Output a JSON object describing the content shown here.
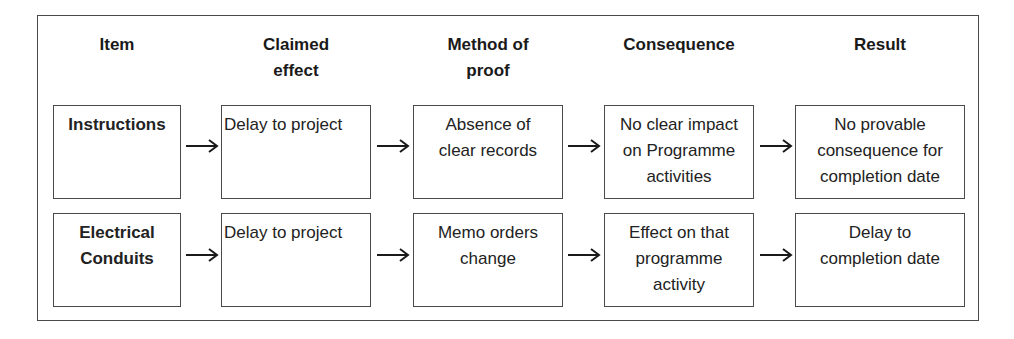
{
  "headers": {
    "item": "Item",
    "claimed_effect": [
      "Claimed",
      "effect"
    ],
    "method_of_proof": [
      "Method of",
      "proof"
    ],
    "consequence": "Consequence",
    "result": "Result"
  },
  "rows": [
    {
      "item": [
        "Instructions"
      ],
      "claimed_effect": [
        "Delay to project"
      ],
      "method_of_proof": [
        "Absence of",
        "clear records"
      ],
      "consequence": [
        "No clear impact",
        "on Programme",
        "activities"
      ],
      "result": [
        "No provable",
        "consequence for",
        "completion date"
      ]
    },
    {
      "item": [
        "Electrical",
        "Conduits"
      ],
      "claimed_effect": [
        "Delay to project"
      ],
      "method_of_proof": [
        "Memo orders",
        "change"
      ],
      "consequence": [
        "Effect on that",
        "programme",
        "activity"
      ],
      "result": [
        "Delay to",
        "completion date"
      ]
    }
  ],
  "arrow_icon": "right-arrow",
  "colors": {
    "border": "#4a4a4a",
    "text": "#1a1a1a",
    "background": "#ffffff"
  }
}
